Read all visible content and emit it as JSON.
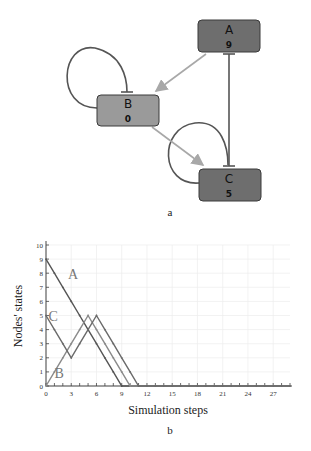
{
  "diagram": {
    "caption": "a",
    "nodes": [
      {
        "id": "A",
        "label": "A",
        "value": "9",
        "fill": "#6e6e6e"
      },
      {
        "id": "B",
        "label": "B",
        "value": "0",
        "fill": "#9a9a9a"
      },
      {
        "id": "C",
        "label": "C",
        "value": "5",
        "fill": "#6e6e6e"
      }
    ],
    "edges": [
      {
        "from": "A",
        "to": "B",
        "type": "activation",
        "color": "#a8a8a8"
      },
      {
        "from": "B",
        "to": "C",
        "type": "activation",
        "color": "#a8a8a8"
      },
      {
        "from": "C",
        "to": "A",
        "type": "inhibition",
        "color": "#555555"
      },
      {
        "from": "A",
        "to": "C",
        "type": "inhibition",
        "color": "#555555"
      },
      {
        "from": "B",
        "to": "B",
        "type": "inhibition-self-loop",
        "color": "#555555"
      },
      {
        "from": "C",
        "to": "C",
        "type": "inhibition-self-loop",
        "color": "#555555"
      }
    ]
  },
  "chart_data": {
    "type": "line",
    "caption": "b",
    "title": "",
    "xlabel": "Simulation steps",
    "ylabel": "Nodes' states",
    "xlim": [
      0,
      29
    ],
    "ylim": [
      0,
      10
    ],
    "xticks": [
      0,
      3,
      6,
      9,
      12,
      15,
      18,
      21,
      24,
      27
    ],
    "yticks": [
      0,
      1,
      2,
      3,
      4,
      5,
      6,
      7,
      8,
      9,
      10
    ],
    "grid": true,
    "x": [
      0,
      1,
      2,
      3,
      4,
      5,
      6,
      7,
      8,
      9,
      10,
      11,
      12,
      13,
      14,
      15,
      16,
      17,
      18,
      19,
      20,
      21,
      22,
      23,
      24,
      25,
      26,
      27,
      28,
      29
    ],
    "series": [
      {
        "name": "A",
        "color": "#555555",
        "values": [
          9,
          8,
          7,
          6,
          5,
          4,
          3,
          2,
          1,
          0,
          0,
          0,
          0,
          0,
          0,
          0,
          0,
          0,
          0,
          0,
          0,
          0,
          0,
          0,
          0,
          0,
          0,
          0,
          0,
          0
        ]
      },
      {
        "name": "B",
        "color": "#8a8a8a",
        "values": [
          0,
          1,
          2,
          3,
          4,
          5,
          4,
          3,
          2,
          1,
          0,
          0,
          0,
          0,
          0,
          0,
          0,
          0,
          0,
          0,
          0,
          0,
          0,
          0,
          0,
          0,
          0,
          0,
          0,
          0
        ]
      },
      {
        "name": "C",
        "color": "#6a6a6a",
        "values": [
          5,
          4,
          3,
          2,
          3,
          4,
          5,
          4,
          3,
          2,
          1,
          0,
          0,
          0,
          0,
          0,
          0,
          0,
          0,
          0,
          0,
          0,
          0,
          0,
          0,
          0,
          0,
          0,
          0,
          0
        ]
      }
    ],
    "annotations": [
      {
        "text": "A",
        "x": 2.6,
        "y": 7.6
      },
      {
        "text": "C",
        "x": 0.3,
        "y": 4.6
      },
      {
        "text": "B",
        "x": 1.0,
        "y": 0.6
      }
    ]
  }
}
